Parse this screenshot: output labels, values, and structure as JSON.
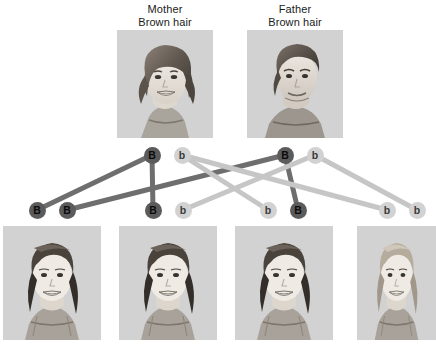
{
  "diagram": {
    "colors": {
      "dominant_allele_fill": "#5b5b5b",
      "recessive_allele_fill": "#d2d2d2",
      "dominant_link": "#6e6e6e",
      "recessive_link": "#c6c6c6",
      "photo_background": "#d2d2d2",
      "page_background": "#ffffff",
      "text": "#1a1a1a"
    }
  },
  "parents": [
    {
      "id": "mother",
      "role_label": "Mother",
      "trait_label": "Brown hair",
      "label_x": 120,
      "label_y": 3,
      "label_w": 90,
      "photo_x": 117,
      "photo_y": 30,
      "photo_w": 96,
      "photo_h": 108,
      "portrait": "woman-smiling-dark-wavy-hair"
    },
    {
      "id": "father",
      "role_label": "Father",
      "trait_label": "Brown hair",
      "label_x": 250,
      "label_y": 3,
      "label_w": 90,
      "photo_x": 247,
      "photo_y": 30,
      "photo_w": 96,
      "photo_h": 108,
      "portrait": "man-smiling-dark-hair"
    }
  ],
  "parent_alleles": [
    {
      "id": "mother-B",
      "symbol": "B",
      "type": "dominant",
      "cx": 152,
      "cy": 155
    },
    {
      "id": "mother-b",
      "symbol": "b",
      "type": "recessive",
      "cx": 182,
      "cy": 155
    },
    {
      "id": "father-B",
      "symbol": "B",
      "type": "dominant",
      "cx": 285,
      "cy": 155
    },
    {
      "id": "father-b",
      "symbol": "b",
      "type": "recessive",
      "cx": 315,
      "cy": 155
    }
  ],
  "offspring_alleles": [
    {
      "id": "child1-a1",
      "symbol": "B",
      "type": "dominant",
      "cx": 37,
      "cy": 210
    },
    {
      "id": "child1-a2",
      "symbol": "B",
      "type": "dominant",
      "cx": 67,
      "cy": 210
    },
    {
      "id": "child2-a1",
      "symbol": "B",
      "type": "dominant",
      "cx": 153,
      "cy": 210
    },
    {
      "id": "child2-a2",
      "symbol": "b",
      "type": "recessive",
      "cx": 183,
      "cy": 210
    },
    {
      "id": "child3-a1",
      "symbol": "b",
      "type": "recessive",
      "cx": 268,
      "cy": 210
    },
    {
      "id": "child3-a2",
      "symbol": "B",
      "type": "dominant",
      "cx": 298,
      "cy": 210
    },
    {
      "id": "child4-a1",
      "symbol": "b",
      "type": "recessive",
      "cx": 387,
      "cy": 210
    },
    {
      "id": "child4-a2",
      "symbol": "b",
      "type": "recessive",
      "cx": 417,
      "cy": 210
    }
  ],
  "links": [
    {
      "id": "link-motherB-child1",
      "from": "mother-B",
      "to": "child1-a1",
      "type": "dominant",
      "x1": 152,
      "y1": 155,
      "x2": 37,
      "y2": 210
    },
    {
      "id": "link-motherB-child2",
      "from": "mother-B",
      "to": "child2-a1",
      "type": "dominant",
      "x1": 152,
      "y1": 155,
      "x2": 153,
      "y2": 210
    },
    {
      "id": "link-fatherB-child1",
      "from": "father-B",
      "to": "child1-a2",
      "type": "dominant",
      "x1": 285,
      "y1": 155,
      "x2": 67,
      "y2": 210
    },
    {
      "id": "link-fatherB-child3",
      "from": "father-B",
      "to": "child3-a2",
      "type": "dominant",
      "x1": 285,
      "y1": 155,
      "x2": 298,
      "y2": 210
    },
    {
      "id": "link-motherb-child3",
      "from": "mother-b",
      "to": "child3-a1",
      "type": "recessive",
      "x1": 182,
      "y1": 155,
      "x2": 268,
      "y2": 210
    },
    {
      "id": "link-motherb-child4",
      "from": "mother-b",
      "to": "child4-a1",
      "type": "recessive",
      "x1": 182,
      "y1": 155,
      "x2": 387,
      "y2": 210
    },
    {
      "id": "link-fatherb-child2",
      "from": "father-b",
      "to": "child2-a2",
      "type": "recessive",
      "x1": 315,
      "y1": 155,
      "x2": 183,
      "y2": 210
    },
    {
      "id": "link-fatherb-child4",
      "from": "father-b",
      "to": "child4-a2",
      "type": "recessive",
      "x1": 315,
      "y1": 155,
      "x2": 417,
      "y2": 210
    }
  ],
  "children": [
    {
      "id": "child1",
      "genotype": "BB",
      "hair": "brown",
      "photo_x": 3,
      "photo_y": 226,
      "photo_w": 98,
      "photo_h": 114,
      "portrait": "girl-brown-hair-smiling"
    },
    {
      "id": "child2",
      "genotype": "Bb",
      "hair": "brown",
      "photo_x": 119,
      "photo_y": 226,
      "photo_w": 98,
      "photo_h": 114,
      "portrait": "girl-brown-hair-smiling"
    },
    {
      "id": "child3",
      "genotype": "bB",
      "hair": "brown",
      "photo_x": 235,
      "photo_y": 226,
      "photo_w": 98,
      "photo_h": 114,
      "portrait": "girl-brown-hair-smiling"
    },
    {
      "id": "child4",
      "genotype": "bb",
      "hair": "blond",
      "photo_x": 357,
      "photo_y": 226,
      "photo_w": 79,
      "photo_h": 114,
      "portrait": "girl-blond-hair-smiling"
    }
  ]
}
